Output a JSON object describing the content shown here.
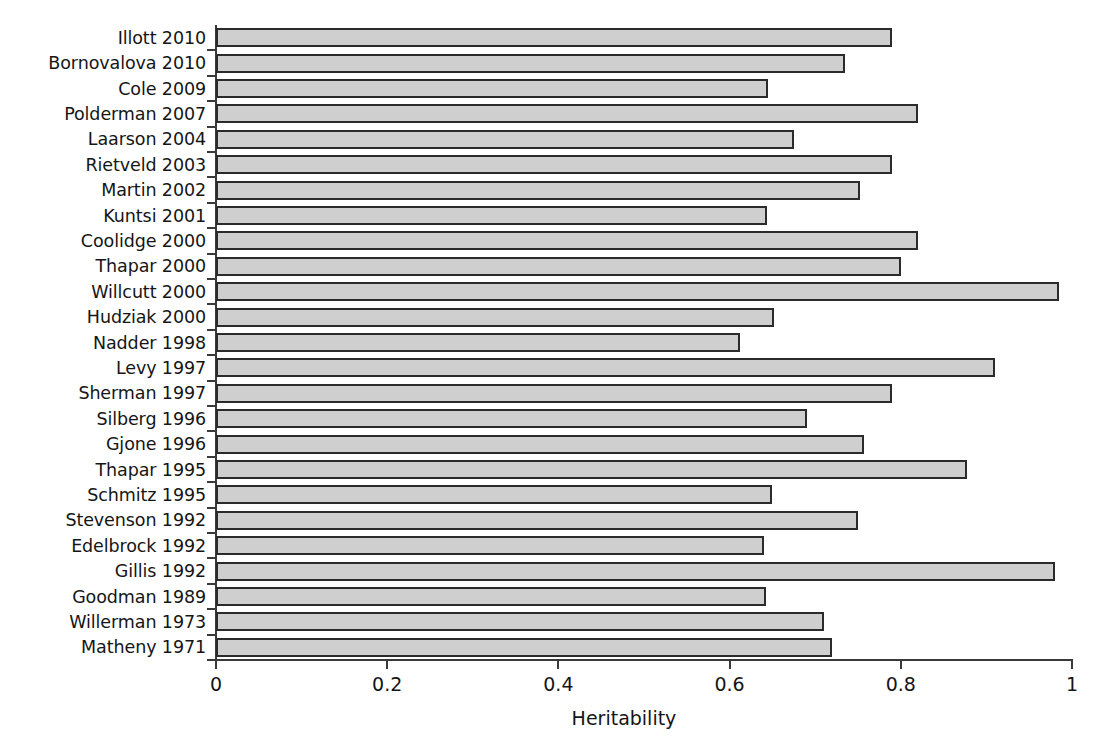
{
  "chart_data": {
    "type": "bar",
    "orientation": "horizontal",
    "title": "",
    "xlabel": "Heritability",
    "ylabel": "",
    "xlim": [
      0,
      1
    ],
    "grid": false,
    "legend": null,
    "xticks": [
      "0",
      "0.2",
      "0.4",
      "0.6",
      "0.8",
      "1"
    ],
    "xtick_values": [
      0,
      0.2,
      0.4,
      0.6,
      0.8,
      1
    ],
    "categories": [
      "Illott 2010",
      "Bornovalova 2010",
      "Cole 2009",
      "Polderman 2007",
      "Laarson 2004",
      "Rietveld 2003",
      "Martin 2002",
      "Kuntsi 2001",
      "Coolidge 2000",
      "Thapar 2000",
      "Willcutt 2000",
      "Hudziak 2000",
      "Nadder 1998",
      "Levy 1997",
      "Sherman 1997",
      "Silberg 1996",
      "Gjone 1996",
      "Thapar 1995",
      "Schmitz 1995",
      "Stevenson 1992",
      "Edelbrock 1992",
      "Gillis 1992",
      "Goodman 1989",
      "Willerman 1973",
      "Matheny 1971"
    ],
    "values": [
      0.79,
      0.735,
      0.645,
      0.82,
      0.675,
      0.79,
      0.752,
      0.644,
      0.82,
      0.8,
      0.985,
      0.652,
      0.612,
      0.91,
      0.79,
      0.69,
      0.757,
      0.877,
      0.65,
      0.75,
      0.64,
      0.98,
      0.642,
      0.71,
      0.72
    ],
    "bar_fill_color": "#cfcfcf",
    "bar_edge_color": "#2b2b2b",
    "axis_color": "#3a3a3a",
    "background_color": "#ffffff"
  }
}
